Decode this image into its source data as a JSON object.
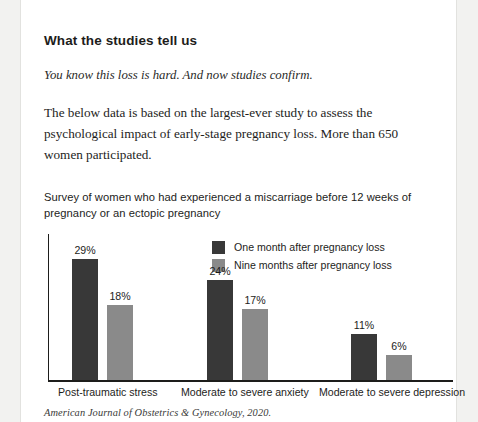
{
  "article": {
    "heading": "What the studies tell us",
    "subtitle": "You know this loss is hard. And now studies confirm.",
    "paragraph": "The below data is based on the largest-ever study to assess the psychological impact of early-stage pregnancy loss. More than 650 women participated."
  },
  "source_note": "American Journal of Obstetrics & Gynecology, 2020.",
  "colors": {
    "series_one_month": "#383838",
    "series_nine_months": "#8a8a8a",
    "axis": "#1d1d1b",
    "text": "#1d1d1b",
    "page_background": "#ffffff",
    "outer_background": "#f2f2f0"
  },
  "chart_data": {
    "type": "bar",
    "title": "Survey of women who had experienced a miscarriage before 12 weeks of pregnancy or an ectopic pregnancy",
    "xlabel": "",
    "ylabel": "",
    "ylim": [
      0,
      35
    ],
    "grid": false,
    "legend_position": "top-center",
    "categories": [
      "Post-traumatic stress",
      "Moderate to severe anxiety",
      "Moderate to severe depression"
    ],
    "series": [
      {
        "name": "One month after pregnancy loss",
        "color": "#383838",
        "values": [
          29,
          24,
          11
        ],
        "labels": [
          "29%",
          "24%",
          "11%"
        ]
      },
      {
        "name": "Nine months after pregnancy loss",
        "color": "#8a8a8a",
        "values": [
          18,
          17,
          6
        ],
        "labels": [
          "18%",
          "17%",
          "6%"
        ]
      }
    ]
  }
}
